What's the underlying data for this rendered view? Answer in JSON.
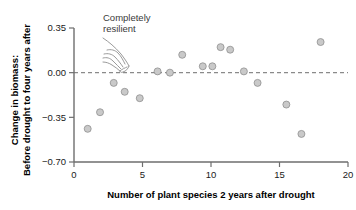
{
  "chart_data": {
    "type": "scatter",
    "title": "",
    "xlabel": "Number of plant species 2 years after drought",
    "ylabel_line1": "Change in biomass:",
    "ylabel_line2": "Before drought to four years after",
    "xlim": [
      0,
      20
    ],
    "ylim": [
      -0.7,
      0.35
    ],
    "xticks": [
      0,
      5,
      10,
      15,
      20
    ],
    "xticklabels": [
      "0",
      "5",
      "10",
      "15",
      "20"
    ],
    "yticks": [
      0.35,
      0.0,
      -0.35,
      -0.7
    ],
    "yticklabels": [
      "0.35",
      "0.00",
      "−0.35",
      "−0.70"
    ],
    "grid": false,
    "legend": null,
    "reference_line": {
      "orientation": "horizontal",
      "value": 0.0,
      "style": "dashed",
      "label": "Completely resilient"
    },
    "annotations": [
      {
        "text_line1": "Completely",
        "text_line2": "resilient",
        "x": 2.2,
        "y": 0.33,
        "pointer": "hand-pointing-icon",
        "points_to": {
          "x": 4.0,
          "y": 0.0
        }
      }
    ],
    "marker": {
      "shape": "circle",
      "fill_color": "#c9c9c9",
      "edge_color": "#8f8f8f",
      "size_px": 4.6
    },
    "points": [
      {
        "x": 1.0,
        "y": -0.44
      },
      {
        "x": 1.9,
        "y": -0.31
      },
      {
        "x": 2.9,
        "y": -0.08
      },
      {
        "x": 3.7,
        "y": -0.15
      },
      {
        "x": 4.8,
        "y": -0.2
      },
      {
        "x": 6.1,
        "y": 0.01
      },
      {
        "x": 7.0,
        "y": 0.0
      },
      {
        "x": 7.9,
        "y": 0.14
      },
      {
        "x": 9.4,
        "y": 0.05
      },
      {
        "x": 10.1,
        "y": 0.05
      },
      {
        "x": 10.7,
        "y": 0.2
      },
      {
        "x": 11.4,
        "y": 0.18
      },
      {
        "x": 12.4,
        "y": 0.01
      },
      {
        "x": 13.4,
        "y": -0.08
      },
      {
        "x": 15.5,
        "y": -0.25
      },
      {
        "x": 16.6,
        "y": -0.48
      },
      {
        "x": 18.0,
        "y": 0.24
      }
    ]
  }
}
